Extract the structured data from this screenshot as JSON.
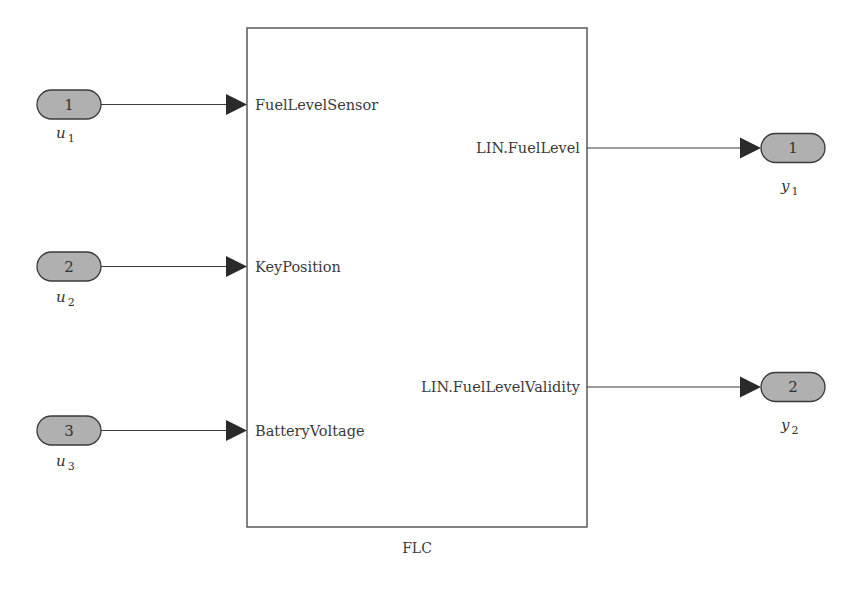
{
  "diagram": {
    "type": "simulink-subsystem",
    "block": {
      "name": "FLC"
    },
    "inports": [
      {
        "number": "1",
        "var": "u",
        "sub": "1",
        "signal": "FuelLevelSensor"
      },
      {
        "number": "2",
        "var": "u",
        "sub": "2",
        "signal": "KeyPosition"
      },
      {
        "number": "3",
        "var": "u",
        "sub": "3",
        "signal": "BatteryVoltage"
      }
    ],
    "outports": [
      {
        "number": "1",
        "var": "y",
        "sub": "1",
        "signal": "LIN.FuelLevel"
      },
      {
        "number": "2",
        "var": "y",
        "sub": "2",
        "signal": "LIN.FuelLevelValidity"
      }
    ],
    "colors": {
      "port_fill": "#b0b0b0",
      "line": "#3a3a3a",
      "block_border": "#5a5a5a",
      "background": "#ffffff"
    }
  }
}
